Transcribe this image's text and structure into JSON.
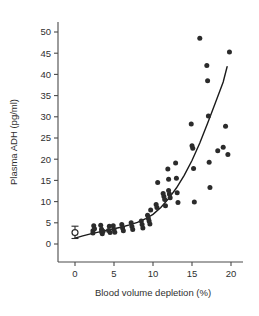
{
  "chart_data": {
    "type": "scatter",
    "title": "",
    "xlabel": "Blood volume depletion (%)",
    "ylabel": "Plasma ADH (pg/ml)",
    "xlim": [
      -1.5,
      21.5
    ],
    "ylim": [
      -2,
      53
    ],
    "xticks": [
      0,
      5,
      10,
      15,
      20
    ],
    "xtick_labels": [
      "0",
      "5",
      "10",
      "15",
      "20"
    ],
    "yticks": [
      0,
      5,
      10,
      15,
      20,
      25,
      30,
      35,
      40,
      45,
      50
    ],
    "ytick_labels": [
      "0",
      "5",
      "10",
      "15",
      "20",
      "25",
      "30",
      "35",
      "40",
      "45",
      "50"
    ],
    "grid": false,
    "legend": "none",
    "series": [
      {
        "name": "Individual subjects",
        "marker": "filled-circle",
        "color": "#2b2b2b",
        "points": [
          [
            2.3,
            3.1
          ],
          [
            2.3,
            2.6
          ],
          [
            2.4,
            4.3
          ],
          [
            2.5,
            3.6
          ],
          [
            3.3,
            4.4
          ],
          [
            3.4,
            3.5
          ],
          [
            3.4,
            2.9
          ],
          [
            3.5,
            2.4
          ],
          [
            3.6,
            3.0
          ],
          [
            4.3,
            3.2
          ],
          [
            4.4,
            4.2
          ],
          [
            4.5,
            2.7
          ],
          [
            4.9,
            4.3
          ],
          [
            5.0,
            3.4
          ],
          [
            5.1,
            2.8
          ],
          [
            6.0,
            4.6
          ],
          [
            6.1,
            3.8
          ],
          [
            6.2,
            3.1
          ],
          [
            7.2,
            5.0
          ],
          [
            7.3,
            4.1
          ],
          [
            7.4,
            3.4
          ],
          [
            8.5,
            5.4
          ],
          [
            8.6,
            4.6
          ],
          [
            8.7,
            3.8
          ],
          [
            9.3,
            6.8
          ],
          [
            9.4,
            6.1
          ],
          [
            9.5,
            5.4
          ],
          [
            9.6,
            4.7
          ],
          [
            9.7,
            8.0
          ],
          [
            10.4,
            9.3
          ],
          [
            10.5,
            8.6
          ],
          [
            10.6,
            14.5
          ],
          [
            11.3,
            11.9
          ],
          [
            11.4,
            11.2
          ],
          [
            11.5,
            10.5
          ],
          [
            11.6,
            9.0
          ],
          [
            11.9,
            17.7
          ],
          [
            12.0,
            15.3
          ],
          [
            12.0,
            12.6
          ],
          [
            12.1,
            11.8
          ],
          [
            12.2,
            10.9
          ],
          [
            12.9,
            19.1
          ],
          [
            13.0,
            15.5
          ],
          [
            13.1,
            12.1
          ],
          [
            13.2,
            9.8
          ],
          [
            14.9,
            28.3
          ],
          [
            15.0,
            23.2
          ],
          [
            15.1,
            22.6
          ],
          [
            15.2,
            17.8
          ],
          [
            15.3,
            9.9
          ],
          [
            16.0,
            48.5
          ],
          [
            16.9,
            42.1
          ],
          [
            17.0,
            38.5
          ],
          [
            17.1,
            30.2
          ],
          [
            17.2,
            19.3
          ],
          [
            17.3,
            13.3
          ],
          [
            18.3,
            22.0
          ],
          [
            19.0,
            22.8
          ],
          [
            19.3,
            27.8
          ],
          [
            19.6,
            21.1
          ],
          [
            19.8,
            45.3
          ]
        ]
      },
      {
        "name": "Baseline mean ± SE",
        "marker": "open-circle-with-error-bar",
        "color": "#2b2b2b",
        "points": [
          [
            0.0,
            2.7
          ]
        ],
        "error_low": 1.3,
        "error_high": 4.2
      }
    ],
    "fit_curve": {
      "name": "Exponential fit",
      "color": "#1b1b1b",
      "points": [
        [
          0.0,
          1.4
        ],
        [
          1.0,
          1.9
        ],
        [
          2.0,
          2.4
        ],
        [
          3.0,
          2.8
        ],
        [
          4.0,
          3.2
        ],
        [
          5.0,
          3.6
        ],
        [
          6.0,
          4.0
        ],
        [
          7.0,
          4.5
        ],
        [
          8.0,
          5.1
        ],
        [
          9.0,
          5.9
        ],
        [
          10.0,
          7.0
        ],
        [
          11.0,
          8.6
        ],
        [
          12.0,
          10.7
        ],
        [
          13.0,
          13.2
        ],
        [
          14.0,
          16.2
        ],
        [
          15.0,
          19.7
        ],
        [
          16.0,
          23.8
        ],
        [
          17.0,
          28.5
        ],
        [
          18.0,
          33.3
        ],
        [
          19.0,
          38.2
        ],
        [
          19.5,
          41.8
        ]
      ]
    }
  }
}
